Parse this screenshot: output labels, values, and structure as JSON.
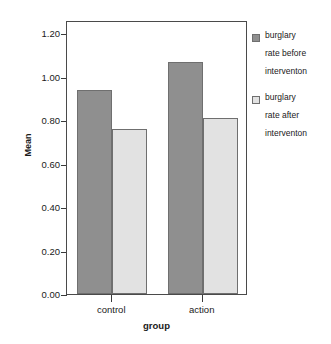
{
  "chart_data": {
    "type": "bar",
    "title": "",
    "xlabel": "group",
    "ylabel": "Mean",
    "categories": [
      "control",
      "action"
    ],
    "series": [
      {
        "name": "burglary rate before interventon",
        "color": "#8f8f8f",
        "values": [
          0.94,
          1.065
        ]
      },
      {
        "name": "burglary rate after interventon",
        "color": "#e2e2e2",
        "values": [
          0.76,
          0.81
        ]
      }
    ],
    "ylim": [
      0.0,
      1.26
    ],
    "yticks": [
      "0.00",
      "0.20",
      "0.40",
      "0.60",
      "0.80",
      "1.00",
      "1.20"
    ],
    "ytick_values": [
      0.0,
      0.2,
      0.4,
      0.6,
      0.8,
      1.0,
      1.2
    ],
    "grid": false,
    "legend_position": "right"
  },
  "legend": {
    "entries": [
      {
        "label": "burglary\nrate before\ninterventon",
        "color": "#8f8f8f"
      },
      {
        "label": "burglary\nrate after\ninterventon",
        "color": "#e2e2e2"
      }
    ]
  },
  "axes": {
    "y_title": "Mean",
    "x_title": "group"
  },
  "colors": {
    "bar_before": "#8f8f8f",
    "bar_after": "#e2e2e2",
    "bar_border": "#6f6f6f",
    "frame": "#4a4a4a",
    "text": "#1a1a1a"
  }
}
